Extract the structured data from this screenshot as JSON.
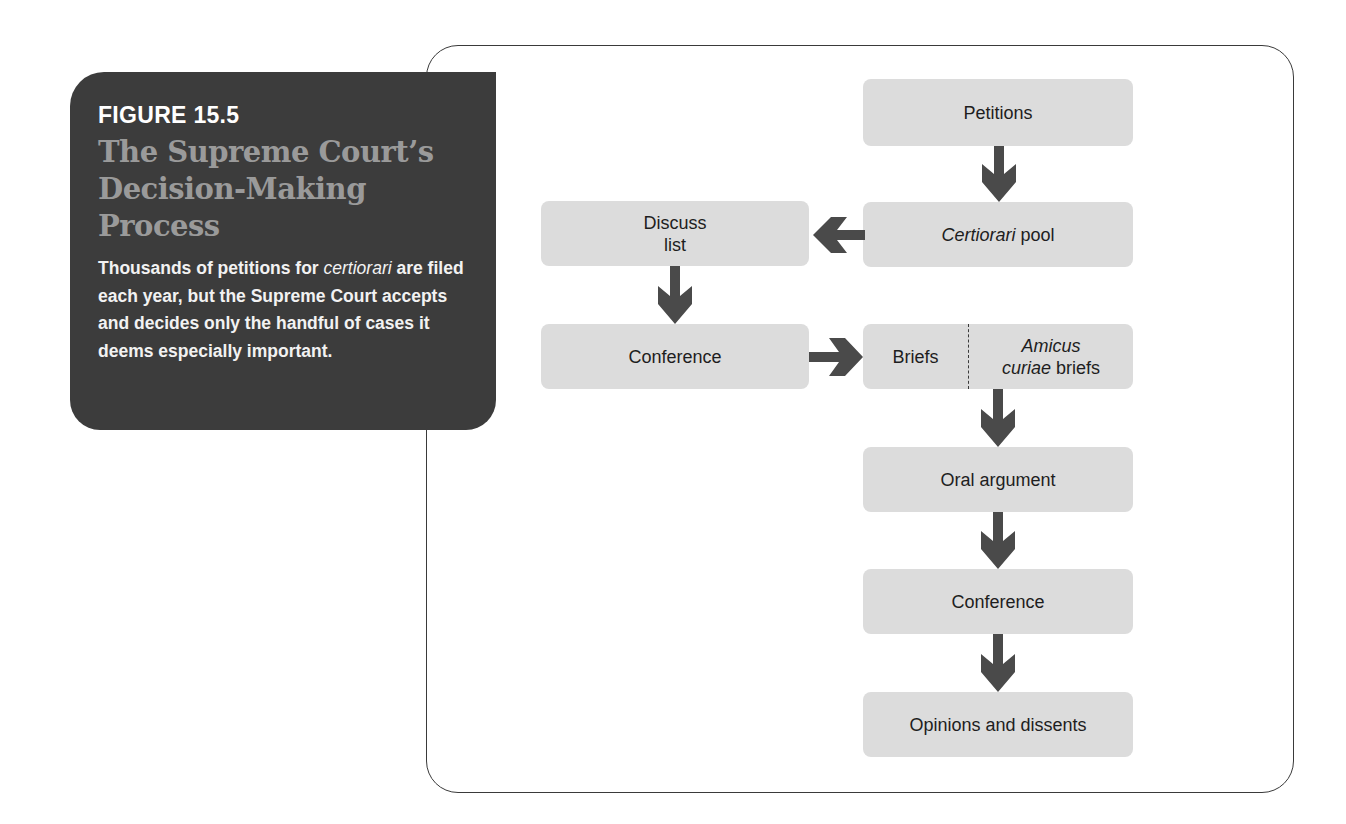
{
  "caption": {
    "figure_label": "FIGURE 15.5",
    "title": "The Supreme Court's Decision-Making Process",
    "title_lines": [
      "The Supreme Court’s",
      "Decision-Making",
      "Process"
    ],
    "description_parts": {
      "before_italic": "Thousands of petitions for ",
      "italic": "certiorari",
      "after_italic": " are filed each year, but the Supreme Court accepts and decides only the handful of cases it deems especially important."
    }
  },
  "flowchart": {
    "nodes": {
      "petitions": {
        "label": "Petitions"
      },
      "certiorari_pool": {
        "label_italic": "Certiorari",
        "label_rest": " pool"
      },
      "discuss_list": {
        "line1": "Discuss",
        "line2": "list"
      },
      "conference_1": {
        "label": "Conference"
      },
      "briefs": {
        "label": "Briefs"
      },
      "amicus_briefs": {
        "line1_italic": "Amicus",
        "line2_italic": "curiae",
        "line2_rest": " briefs"
      },
      "oral_argument": {
        "label": "Oral argument"
      },
      "conference_2": {
        "label": "Conference"
      },
      "opinions": {
        "label": "Opinions and dissents"
      }
    },
    "edges": [
      {
        "from": "Petitions",
        "to": "Certiorari pool",
        "direction": "down"
      },
      {
        "from": "Certiorari pool",
        "to": "Discuss list",
        "direction": "left"
      },
      {
        "from": "Discuss list",
        "to": "Conference",
        "direction": "down"
      },
      {
        "from": "Conference",
        "to": "Briefs / Amicus curiae briefs",
        "direction": "right"
      },
      {
        "from": "Briefs / Amicus curiae briefs",
        "to": "Oral argument",
        "direction": "down"
      },
      {
        "from": "Oral argument",
        "to": "Conference",
        "direction": "down"
      },
      {
        "from": "Conference",
        "to": "Opinions and dissents",
        "direction": "down"
      }
    ]
  },
  "colors": {
    "caption_bg": "#3c3c3c",
    "caption_title": "#9a9a9a",
    "box_fill": "#dcdcdc",
    "arrow_fill": "#4a4a4a",
    "frame_border": "#3a3a3a"
  }
}
